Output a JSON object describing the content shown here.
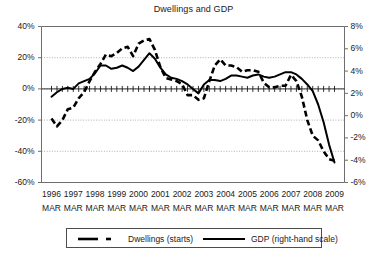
{
  "chart_data": {
    "type": "line",
    "title": "Dwellings and GDP",
    "xlabel": "",
    "ylabel": "",
    "grid": true,
    "legend_position": "bottom",
    "x_tick_years": [
      "1996",
      "1997",
      "1998",
      "1999",
      "2000",
      "2001",
      "2002",
      "2003",
      "2004",
      "2005",
      "2006",
      "2007",
      "2008",
      "2009"
    ],
    "x_tick_month": "MAR",
    "x_tick_labels": [
      "1996 MAR",
      "1997 MAR",
      "1998 MAR",
      "1999 MAR",
      "2000 MAR",
      "2001 MAR",
      "2002 MAR",
      "2003 MAR",
      "2004 MAR",
      "2005 MAR",
      "2006 MAR",
      "2007 MAR",
      "2008 MAR",
      "2009 MAR"
    ],
    "y_left": {
      "label": "",
      "ticks": [
        "40%",
        "20%",
        "0%",
        "-20%",
        "-40%",
        "-60%"
      ],
      "tick_values": [
        40,
        20,
        0,
        -20,
        -40,
        -60
      ],
      "lim": [
        -60,
        40
      ]
    },
    "y_right": {
      "label": "",
      "ticks": [
        "8%",
        "6%",
        "4%",
        "2%",
        "0%",
        "-2%",
        "-4%",
        "-6%"
      ],
      "tick_values": [
        8,
        6,
        4,
        2,
        0,
        -2,
        -4,
        -6
      ],
      "lim": [
        -6,
        8
      ]
    },
    "series": [
      {
        "name": "Dwellings (starts)",
        "axis": "left",
        "style": "dashed",
        "color": "#000000",
        "x": [
          1996.0,
          1996.25,
          1996.5,
          1996.75,
          1997.0,
          1997.25,
          1997.5,
          1997.75,
          1998.0,
          1998.25,
          1998.5,
          1998.75,
          1999.0,
          1999.25,
          1999.5,
          1999.75,
          2000.0,
          2000.25,
          2000.5,
          2000.75,
          2001.0,
          2001.25,
          2001.5,
          2001.75,
          2002.0,
          2002.25,
          2002.5,
          2002.75,
          2003.0,
          2003.25,
          2003.5,
          2003.75,
          2004.0,
          2004.25,
          2004.5,
          2004.75,
          2005.0,
          2005.25,
          2005.5,
          2005.75,
          2006.0,
          2006.25,
          2006.5,
          2006.75,
          2007.0,
          2007.25,
          2007.5,
          2007.75,
          2008.0,
          2008.25,
          2008.5,
          2008.75,
          2009.0
        ],
        "values": [
          -19,
          -24,
          -20,
          -13,
          -12,
          -6,
          -2,
          5,
          11,
          16,
          22,
          21,
          23,
          26,
          27,
          21,
          29,
          31,
          32,
          25,
          14,
          7,
          6,
          5,
          3,
          -4,
          -4,
          -7,
          -6,
          5,
          15,
          19,
          15,
          15,
          14,
          11,
          12,
          12,
          11,
          4,
          1,
          1,
          2,
          2,
          9,
          5,
          -5,
          -20,
          -30,
          -33,
          -40,
          -45,
          -46
        ]
      },
      {
        "name": "GDP (right-hand scale)",
        "axis": "right",
        "style": "solid",
        "color": "#000000",
        "x": [
          1996.0,
          1996.25,
          1996.5,
          1996.75,
          1997.0,
          1997.25,
          1997.5,
          1997.75,
          1998.0,
          1998.25,
          1998.5,
          1998.75,
          1999.0,
          1999.25,
          1999.5,
          1999.75,
          2000.0,
          2000.25,
          2000.5,
          2000.75,
          2001.0,
          2001.25,
          2001.5,
          2001.75,
          2002.0,
          2002.25,
          2002.5,
          2002.75,
          2003.0,
          2003.25,
          2003.5,
          2003.75,
          2004.0,
          2004.25,
          2004.5,
          2004.75,
          2005.0,
          2005.25,
          2005.5,
          2005.75,
          2006.0,
          2006.25,
          2006.5,
          2006.75,
          2007.0,
          2007.25,
          2007.5,
          2007.75,
          2008.0,
          2008.25,
          2008.5,
          2008.75,
          2009.0
        ],
        "values": [
          1.7,
          2.1,
          2.4,
          2.5,
          2.4,
          2.9,
          3.1,
          3.3,
          3.8,
          4.5,
          4.5,
          4.2,
          4.3,
          4.5,
          4.3,
          4.0,
          4.4,
          5.0,
          5.6,
          5.1,
          4.3,
          3.7,
          3.4,
          3.3,
          3.1,
          2.8,
          2.4,
          2.0,
          2.8,
          3.2,
          3.2,
          3.1,
          3.3,
          3.6,
          3.6,
          3.5,
          3.4,
          3.6,
          3.7,
          3.5,
          3.4,
          3.5,
          3.7,
          3.9,
          3.9,
          3.7,
          3.3,
          2.8,
          2.2,
          1.0,
          -0.6,
          -2.6,
          -4.2
        ]
      }
    ]
  },
  "legend": {
    "entries": [
      {
        "label": "Dwellings (starts)",
        "style": "dashed"
      },
      {
        "label": "GDP (right-hand scale)",
        "style": "solid"
      }
    ]
  }
}
